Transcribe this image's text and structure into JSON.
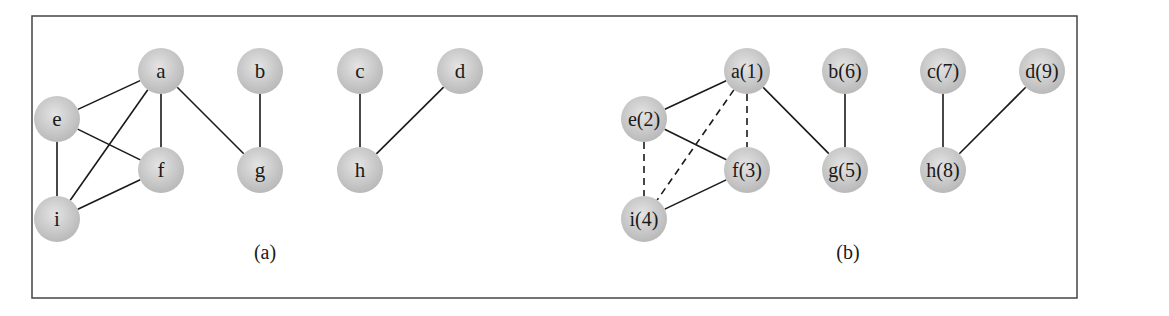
{
  "figure": {
    "frame": {
      "x": 32,
      "y": 16,
      "width": 1045,
      "height": 282,
      "stroke": "#444444"
    },
    "node_radius": 23,
    "node_fill": "#b9b9b9",
    "node_highlight": "#e4e4e4",
    "edge_color": "#1a1a1a",
    "panels": [
      {
        "id": "a",
        "caption": "(a)",
        "caption_pos": {
          "x": 265,
          "y": 259
        },
        "label_font_size": 21,
        "nodes": [
          {
            "id": "a",
            "label": "a",
            "x": 161,
            "y": 71
          },
          {
            "id": "b",
            "label": "b",
            "x": 260,
            "y": 71
          },
          {
            "id": "c",
            "label": "c",
            "x": 360,
            "y": 71
          },
          {
            "id": "d",
            "label": "d",
            "x": 460,
            "y": 71
          },
          {
            "id": "e",
            "label": "e",
            "x": 57,
            "y": 119
          },
          {
            "id": "f",
            "label": "f",
            "x": 161,
            "y": 170
          },
          {
            "id": "g",
            "label": "g",
            "x": 260,
            "y": 170
          },
          {
            "id": "h",
            "label": "h",
            "x": 360,
            "y": 170
          },
          {
            "id": "i",
            "label": "i",
            "x": 57,
            "y": 219
          }
        ],
        "edges": [
          {
            "from": "a",
            "to": "e",
            "style": "solid"
          },
          {
            "from": "a",
            "to": "f",
            "style": "solid"
          },
          {
            "from": "a",
            "to": "i",
            "style": "solid"
          },
          {
            "from": "a",
            "to": "g",
            "style": "solid"
          },
          {
            "from": "e",
            "to": "f",
            "style": "solid"
          },
          {
            "from": "e",
            "to": "i",
            "style": "solid"
          },
          {
            "from": "f",
            "to": "i",
            "style": "solid"
          },
          {
            "from": "b",
            "to": "g",
            "style": "solid"
          },
          {
            "from": "c",
            "to": "h",
            "style": "solid"
          },
          {
            "from": "d",
            "to": "h",
            "style": "solid"
          }
        ]
      },
      {
        "id": "b",
        "caption": "(b)",
        "caption_pos": {
          "x": 848,
          "y": 259
        },
        "label_font_size": 20,
        "nodes": [
          {
            "id": "a",
            "label": "a(1)",
            "x": 747,
            "y": 71
          },
          {
            "id": "b",
            "label": "b(6)",
            "x": 845,
            "y": 71
          },
          {
            "id": "c",
            "label": "c(7)",
            "x": 943,
            "y": 71
          },
          {
            "id": "d",
            "label": "d(9)",
            "x": 1042,
            "y": 71
          },
          {
            "id": "e",
            "label": "e(2)",
            "x": 644,
            "y": 119
          },
          {
            "id": "f",
            "label": "f(3)",
            "x": 747,
            "y": 170
          },
          {
            "id": "g",
            "label": "g(5)",
            "x": 845,
            "y": 170
          },
          {
            "id": "h",
            "label": "h(8)",
            "x": 943,
            "y": 170
          },
          {
            "id": "i",
            "label": "i(4)",
            "x": 644,
            "y": 219
          }
        ],
        "edges": [
          {
            "from": "a",
            "to": "e",
            "style": "solid"
          },
          {
            "from": "a",
            "to": "f",
            "style": "dashed"
          },
          {
            "from": "a",
            "to": "i",
            "style": "dashed"
          },
          {
            "from": "a",
            "to": "g",
            "style": "solid"
          },
          {
            "from": "e",
            "to": "f",
            "style": "solid"
          },
          {
            "from": "e",
            "to": "i",
            "style": "dashed"
          },
          {
            "from": "f",
            "to": "i",
            "style": "solid"
          },
          {
            "from": "b",
            "to": "g",
            "style": "solid"
          },
          {
            "from": "c",
            "to": "h",
            "style": "solid"
          },
          {
            "from": "d",
            "to": "h",
            "style": "solid"
          }
        ]
      }
    ]
  }
}
